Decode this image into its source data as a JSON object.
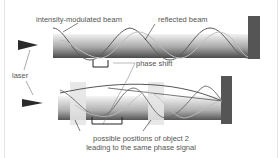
{
  "labels": {
    "intensity_modulated_beam": "intensity-modulated beam",
    "reflected_beam": "reflected beam",
    "laser": "laser",
    "phase_shift": "phase shift",
    "possible_positions_line1": "possible positions of object 2",
    "possible_positions_line2": "leading to the same phase signal"
  },
  "colors": {
    "beam_dark": "#4a4a4a",
    "beam_light": "#d8d8d8",
    "target": "#555555",
    "wave": "#666666",
    "text": "#555555"
  }
}
